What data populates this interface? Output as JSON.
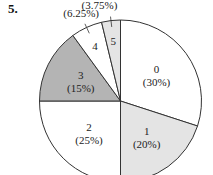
{
  "problem_number": "5.",
  "chart_data": {
    "type": "pie",
    "title": "",
    "start_angle": "12 o'clock",
    "direction": "clockwise",
    "slices": [
      {
        "label": "0",
        "value": 30,
        "pct_text": "(30%)",
        "color": "#ffffff"
      },
      {
        "label": "1",
        "value": 20,
        "pct_text": "(20%)",
        "color": "#e4e4e4"
      },
      {
        "label": "2",
        "value": 25,
        "pct_text": "(25%)",
        "color": "#ffffff"
      },
      {
        "label": "3",
        "value": 15,
        "pct_text": "(15%)",
        "color": "#b4b4b4"
      },
      {
        "label": "4",
        "value": 6.25,
        "pct_text": "(6.25%)",
        "color": "#ffffff"
      },
      {
        "label": "5",
        "value": 3.75,
        "pct_text": "(3.75%)",
        "color": "#e4e4e4"
      }
    ]
  }
}
